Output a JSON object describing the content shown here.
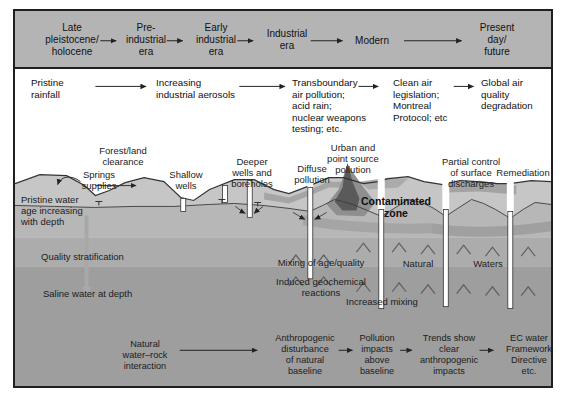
{
  "timeline": {
    "items": [
      {
        "label": "Late\npleistocene/\nholocene"
      },
      {
        "label": "Pre-\nindustrial\nera"
      },
      {
        "label": "Early\nindustrial\nera"
      },
      {
        "label": "Industrial\nera"
      },
      {
        "label": "Modern"
      },
      {
        "label": "Present\nday/\nfuture"
      }
    ]
  },
  "air_row": {
    "items": [
      {
        "label": "Pristine\nrainfall"
      },
      {
        "label": "Increasing\nindustrial aerosols"
      },
      {
        "label": "Transboundary\nair pollution;\nacid rain;\nnuclear weapons\ntesting; etc."
      },
      {
        "label": "Clean air\nlegislation;\nMontreal\nProtocol; etc"
      },
      {
        "label": "Global air\nquality\ndegradation"
      }
    ]
  },
  "surface_labels": {
    "forest": "Forest/land\nclearance",
    "springs": "Springs\nsupplies",
    "shallow": "Shallow\nwells",
    "deeper": "Deeper\nwells and\nboreholes",
    "diffuse": "Diffuse\npollution",
    "urban": "Urban and\npoint source\npollution",
    "partial": "Partial control\nof surface\ndischarges",
    "remediation": "Remediation"
  },
  "underground_labels": {
    "pristine": "Pristine water\nage increasing\nwith depth",
    "quality": "Quality stratification",
    "saline": "Saline water at depth",
    "contaminated": "Contaminated\nzone",
    "mixing": "Mixing of age/quality",
    "induced": "Induced geochemical\nreactions",
    "increased": "Increased mixing",
    "natural": "Natural",
    "waters": "Waters"
  },
  "bottom_row": {
    "items": [
      {
        "label": "Natural\nwater–rock\ninteraction"
      },
      {
        "label": "Anthropogenic\ndisturbance\nof natural\nbaseline"
      },
      {
        "label": "Pollution\nimpacts\nabove\nbaseline"
      },
      {
        "label": "Trends show\nclear\nanthropogenic\nimpacts"
      },
      {
        "label": "EC water\nFramework\nDirective\netc."
      }
    ]
  },
  "colors": {
    "timeline_band": "#b4b4b4",
    "vadose_zone": "#c6c6c6",
    "layer_upper": "#b7b7b7",
    "layer_mid": "#acacac",
    "layer_deep": "#9e9e9e",
    "plume_halo": "#8f8f8f",
    "plume_core": "#5a5a5a",
    "line": "#333333"
  }
}
